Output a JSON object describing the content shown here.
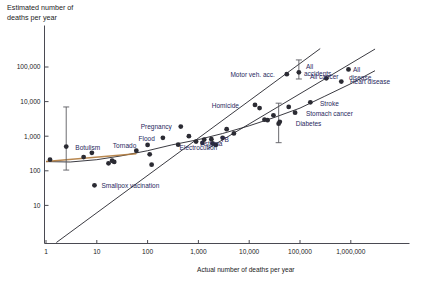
{
  "figure": {
    "title_y": "Estimated number of\ndeaths per year",
    "title_x": "Actual number of deaths per year",
    "background": "#ffffff",
    "dot_color": "#2b2b33",
    "label_color": "#27285c",
    "axis_color": "#4a4a52"
  },
  "chart_data": {
    "type": "scatter",
    "title": "",
    "subtitle": "",
    "xlabel": "Actual number of deaths per year",
    "ylabel": "Estimated number of deaths per year",
    "xscale": "log",
    "yscale": "log",
    "xlim": [
      1,
      3000000
    ],
    "ylim": [
      3,
      700000
    ],
    "grid": false,
    "legend": "none",
    "xticks": [
      "1",
      "10",
      "100",
      "1,000",
      "10,000",
      "100,000",
      "1,000,000"
    ],
    "xtick_values": [
      1,
      10,
      100,
      1000,
      10000,
      100000,
      1000000
    ],
    "yticks": [
      "10",
      "100",
      "1,000",
      "10,000",
      "100,000"
    ],
    "ytick_values": [
      10,
      100,
      1000,
      10000,
      100000
    ],
    "annotations": [
      {
        "text": "Botulism",
        "x": 2.4,
        "y": 500
      },
      {
        "text": "Smallpox vacination",
        "x": 9,
        "y": 38
      },
      {
        "text": "Tornado",
        "x": 90,
        "y": 570
      },
      {
        "text": "Flood",
        "x": 190,
        "y": 900
      },
      {
        "text": "Pregnancy",
        "x": 450,
        "y": 2000
      },
      {
        "text": "TB",
        "x": 1900,
        "y": 810
      },
      {
        "text": "Asthma",
        "x": 1800,
        "y": 640
      },
      {
        "text": "Electrocution",
        "x": 1000,
        "y": 500
      },
      {
        "text": "Homicide",
        "x": 9000,
        "y": 8000
      },
      {
        "text": "Motor veh. acc.",
        "x": 46000,
        "y": 65000
      },
      {
        "text": "All accidents",
        "x": 95000,
        "y": 90000
      },
      {
        "text": "All cancer",
        "x": 300000,
        "y": 55000
      },
      {
        "text": "All disease",
        "x": 1100000,
        "y": 70000
      },
      {
        "text": "Heart disease",
        "x": 700000,
        "y": 40000
      },
      {
        "text": "Stroke",
        "x": 180000,
        "y": 9000
      },
      {
        "text": "Stomach cancer",
        "x": 95000,
        "y": 4800
      },
      {
        "text": "Diabetes",
        "x": 60000,
        "y": 2400
      }
    ],
    "series": [
      {
        "name": "Lethal events",
        "points": [
          {
            "label": "Electrocution",
            "x": 1.2,
            "y": 210
          },
          {
            "label": "Botulism",
            "x": 2.5,
            "y": 500
          },
          {
            "label": "",
            "x": 5.5,
            "y": 250
          },
          {
            "label": "",
            "x": 8,
            "y": 330
          },
          {
            "label": "Smallpox vacination",
            "x": 9,
            "y": 38
          },
          {
            "label": "",
            "x": 17,
            "y": 165
          },
          {
            "label": "",
            "x": 22,
            "y": 180
          },
          {
            "label": "",
            "x": 20,
            "y": 195
          },
          {
            "label": "",
            "x": 60,
            "y": 380
          },
          {
            "label": "",
            "x": 110,
            "y": 300
          },
          {
            "label": "Tornado",
            "x": 100,
            "y": 560
          },
          {
            "label": "",
            "x": 120,
            "y": 150
          },
          {
            "label": "Flood",
            "x": 200,
            "y": 900
          },
          {
            "label": "Pregnancy",
            "x": 450,
            "y": 1900
          },
          {
            "label": "",
            "x": 400,
            "y": 570
          },
          {
            "label": "",
            "x": 650,
            "y": 1000
          },
          {
            "label": "",
            "x": 900,
            "y": 700
          },
          {
            "label": "",
            "x": 1200,
            "y": 640
          },
          {
            "label": "",
            "x": 1300,
            "y": 800
          },
          {
            "label": "TB",
            "x": 1800,
            "y": 820
          },
          {
            "label": "Asthma",
            "x": 1900,
            "y": 620
          },
          {
            "label": "",
            "x": 2200,
            "y": 560
          },
          {
            "label": "",
            "x": 3000,
            "y": 900
          },
          {
            "label": "",
            "x": 3600,
            "y": 1600
          },
          {
            "label": "",
            "x": 5000,
            "y": 1200
          },
          {
            "label": "Homicide",
            "x": 13000,
            "y": 8000
          },
          {
            "label": "",
            "x": 16000,
            "y": 6500
          },
          {
            "label": "",
            "x": 20000,
            "y": 3000
          },
          {
            "label": "",
            "x": 23000,
            "y": 2900
          },
          {
            "label": "",
            "x": 30000,
            "y": 4000
          },
          {
            "label": "",
            "x": 40000,
            "y": 2600
          },
          {
            "label": "Diabetes",
            "x": 38000,
            "y": 2300
          },
          {
            "label": "Motor veh. acc.",
            "x": 55000,
            "y": 62000
          },
          {
            "label": "",
            "x": 60000,
            "y": 7000
          },
          {
            "label": "Stomach cancer",
            "x": 80000,
            "y": 4800
          },
          {
            "label": "All accidents",
            "x": 95000,
            "y": 70000
          },
          {
            "label": "Stroke",
            "x": 160000,
            "y": 9500
          },
          {
            "label": "All cancer",
            "x": 330000,
            "y": 47000
          },
          {
            "label": "Heart disease",
            "x": 650000,
            "y": 38000
          },
          {
            "label": "All disease",
            "x": 900000,
            "y": 85000
          }
        ]
      }
    ],
    "error_bars": [
      {
        "label": "Botulism",
        "x": 2.5,
        "y": 500,
        "low": 105,
        "high": 7000
      },
      {
        "label": "All accidents",
        "x": 95000,
        "y": 70000,
        "low": 45000,
        "high": 160000
      },
      {
        "label": "Diabetes",
        "x": 38000,
        "y": 2300,
        "low": 650,
        "high": 9000
      }
    ],
    "reference_lines": [
      {
        "name": "identity",
        "kind": "diagonal",
        "note": "y = x"
      },
      {
        "name": "fit",
        "kind": "curve",
        "note": "fitted calibration curve"
      }
    ]
  }
}
